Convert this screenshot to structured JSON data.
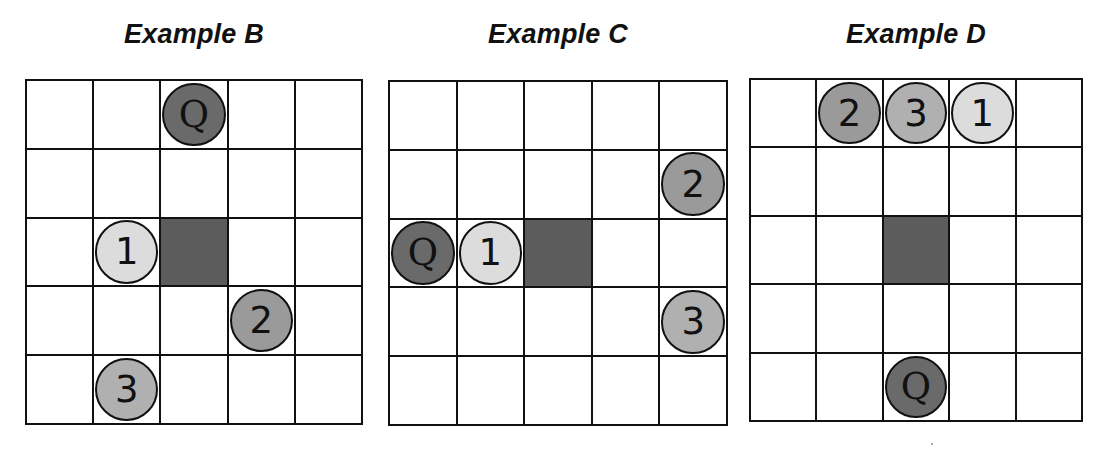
{
  "figure": {
    "panels": [
      {
        "title": "Example B",
        "grid": {
          "left": 25,
          "top": 79,
          "width": 338,
          "height": 346,
          "rows": 5,
          "cols": 5
        },
        "blocked_cell": {
          "row": 2,
          "col": 2
        },
        "tokens": [
          {
            "label": "Q",
            "row": 0,
            "col": 2,
            "color": "#6a6a6a",
            "kind": "query"
          },
          {
            "label": "1",
            "row": 2,
            "col": 1,
            "color": "#dcdcdc",
            "kind": "rank"
          },
          {
            "label": "2",
            "row": 3,
            "col": 3,
            "color": "#9a9a9a",
            "kind": "rank"
          },
          {
            "label": "3",
            "row": 4,
            "col": 1,
            "color": "#b0b0b0",
            "kind": "rank"
          }
        ]
      },
      {
        "title": "Example C",
        "grid": {
          "left": 388,
          "top": 80,
          "width": 340,
          "height": 346,
          "rows": 5,
          "cols": 5
        },
        "blocked_cell": {
          "row": 2,
          "col": 2
        },
        "tokens": [
          {
            "label": "Q",
            "row": 2,
            "col": 0,
            "color": "#6a6a6a",
            "kind": "query"
          },
          {
            "label": "1",
            "row": 2,
            "col": 1,
            "color": "#dcdcdc",
            "kind": "rank"
          },
          {
            "label": "2",
            "row": 1,
            "col": 4,
            "color": "#9a9a9a",
            "kind": "rank"
          },
          {
            "label": "3",
            "row": 3,
            "col": 4,
            "color": "#b0b0b0",
            "kind": "rank"
          }
        ]
      },
      {
        "title": "Example D",
        "grid": {
          "left": 749,
          "top": 78,
          "width": 334,
          "height": 344,
          "rows": 5,
          "cols": 5
        },
        "blocked_cell": {
          "row": 2,
          "col": 2
        },
        "tokens": [
          {
            "label": "2",
            "row": 0,
            "col": 1,
            "color": "#9a9a9a",
            "kind": "rank"
          },
          {
            "label": "3",
            "row": 0,
            "col": 2,
            "color": "#b0b0b0",
            "kind": "rank"
          },
          {
            "label": "1",
            "row": 0,
            "col": 3,
            "color": "#dcdcdc",
            "kind": "rank"
          },
          {
            "label": "Q",
            "row": 4,
            "col": 2,
            "color": "#6a6a6a",
            "kind": "query"
          }
        ]
      }
    ],
    "colors": {
      "grid_line": "#111111",
      "blocked": "#5c5c5c",
      "background": "#ffffff"
    }
  }
}
